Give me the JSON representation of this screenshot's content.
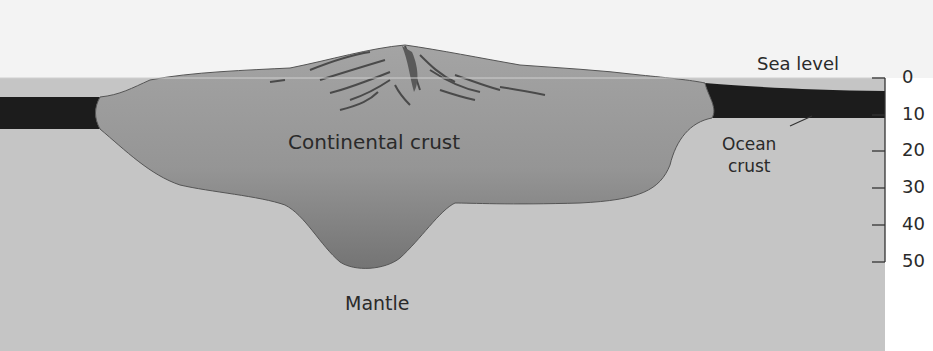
{
  "labels": {
    "continental_crust": "Continental crust",
    "mantle": "Mantle",
    "sea_level": "Sea level",
    "ocean_crust_line1": "Ocean",
    "ocean_crust_line2": "crust"
  },
  "depth_scale": {
    "ticks": [
      "0",
      "10",
      "20",
      "30",
      "40",
      "50"
    ]
  },
  "colors": {
    "background_top": "#f2f2f2",
    "mantle": "#c6c6c6",
    "continental_crust": "#9e9e9e",
    "continental_crust_deep": "#7c7c7c",
    "ocean_crust": "#1c1c1c",
    "outline": "#555555",
    "text": "#2a2a2a"
  }
}
